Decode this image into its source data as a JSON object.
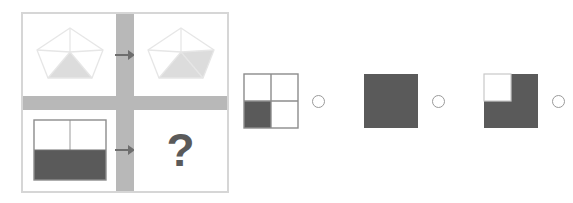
{
  "puzzle": {
    "type": "visual-analogy-matrix",
    "colors": {
      "fill_dark": "#5a5a5a",
      "fill_light": "#d8d8d8",
      "outline_light": "#e8e8e8",
      "separator": "#b8b8b8",
      "frame": "#d6d6d6",
      "radio_outline": "#9a9a9a",
      "background": "#ffffff",
      "question_mark": "#5a5a5a"
    },
    "matrix": {
      "name": "analogy-matrix",
      "rows": [
        {
          "name": "row-1-pentagons",
          "source": {
            "name": "pentagon-one-triangle-shaded",
            "shape": "pentagon",
            "description": "Pentagon with internal triangulation lines from apex; bottom-centre triangle shaded",
            "shaded_regions": 1,
            "shaded_fraction_label": "1/4"
          },
          "operator": "arrow-right",
          "target": {
            "name": "pentagon-two-regions-shaded",
            "shape": "pentagon",
            "description": "Pentagon with internal triangulation lines; bottom-centre and bottom-right regions shaded",
            "shaded_regions": 2,
            "shaded_fraction_label": "2/4"
          }
        },
        {
          "name": "row-2-squares",
          "source": {
            "name": "square-bottom-half-shaded",
            "shape": "square-quadrants",
            "description": "Square divided into four quadrants; both bottom quadrants shaded dark",
            "quadrants": [
              false,
              false,
              true,
              true
            ],
            "shaded_fraction_label": "2/4"
          },
          "operator": "arrow-right",
          "target": {
            "name": "unknown-cell",
            "shape": "question-mark",
            "label": "?"
          }
        }
      ]
    },
    "options": [
      {
        "name": "option-1",
        "index": 1,
        "shape": "square-quadrants",
        "description": "Square with four quadrants outlined; only the bottom-left quadrant shaded dark",
        "quadrants": [
          false,
          false,
          true,
          false
        ],
        "shaded_fraction_label": "1/4",
        "selected": false
      },
      {
        "name": "option-2",
        "index": 2,
        "shape": "square-solid",
        "description": "Completely filled dark square",
        "quadrants": [
          true,
          true,
          true,
          true
        ],
        "shaded_fraction_label": "4/4",
        "selected": false
      },
      {
        "name": "option-3",
        "index": 3,
        "shape": "square-quadrants",
        "description": "Filled dark square with the top-left quadrant left white",
        "quadrants": [
          false,
          true,
          true,
          true
        ],
        "shaded_fraction_label": "3/4",
        "selected": false
      }
    ]
  }
}
